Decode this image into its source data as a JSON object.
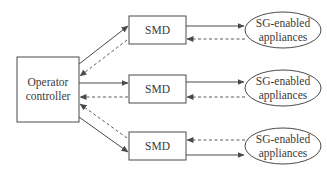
{
  "diagram": {
    "controller": {
      "line1": "Operator",
      "line2": "controller"
    },
    "smds": [
      {
        "label": "SMD"
      },
      {
        "label": "SMD"
      },
      {
        "label": "SMD"
      }
    ],
    "appliances": [
      {
        "line1": "SG-enabled",
        "line2": "appliances"
      },
      {
        "line1": "SG-enabled",
        "line2": "appliances"
      },
      {
        "line1": "SG-enabled",
        "line2": "appliances"
      }
    ],
    "legend": {
      "solid_arrow": "controller to SMD to appliances",
      "dashed_arrow": "appliances to SMD to controller"
    },
    "colors": {
      "stroke": "#4a4a4a",
      "text": "#3a3a3a",
      "background": "#ffffff"
    }
  }
}
